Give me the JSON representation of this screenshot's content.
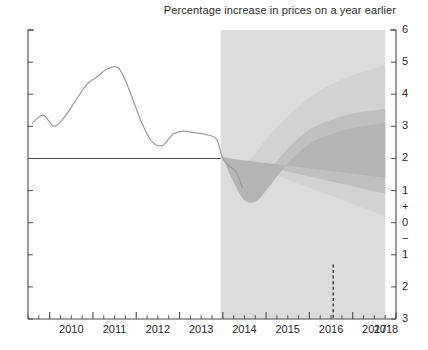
{
  "chart_data": {
    "type": "area",
    "title": "Percentage increase in prices on a year earlier",
    "subtitle": "",
    "xlabel": "",
    "ylabel": "",
    "grid": false,
    "legend_position": "none",
    "xlim": [
      2009.5,
      2018.0
    ],
    "ylim": [
      -3,
      6
    ],
    "y_ticks": [
      {
        "value": 6,
        "label": "6"
      },
      {
        "value": 5,
        "label": "5"
      },
      {
        "value": 4,
        "label": "4"
      },
      {
        "value": 3,
        "label": "3"
      },
      {
        "value": 2,
        "label": "2"
      },
      {
        "value": 1,
        "label": "1"
      },
      {
        "value": 0.5,
        "label": "+"
      },
      {
        "value": 0,
        "label": "0"
      },
      {
        "value": -0.5,
        "label": "−"
      },
      {
        "value": -1,
        "label": "1"
      },
      {
        "value": -2,
        "label": "2"
      },
      {
        "value": -3,
        "label": "3"
      }
    ],
    "x_ticks": [
      {
        "value": 2010,
        "label": "2010"
      },
      {
        "value": 2011,
        "label": "2011"
      },
      {
        "value": 2012,
        "label": "2012"
      },
      {
        "value": 2013,
        "label": "2013"
      },
      {
        "value": 2014,
        "label": "2014"
      },
      {
        "value": 2015,
        "label": "2015"
      },
      {
        "value": 2016,
        "label": "2016"
      },
      {
        "value": 2017,
        "label": "2017"
      },
      {
        "value": 2018,
        "label": "2018"
      }
    ],
    "x_minor_tick_step": 0.25,
    "annotations": [
      {
        "name": "inflation-target-line",
        "type": "hline",
        "y": 2.0,
        "x_start": 2009.5,
        "x_end": 2013.95,
        "style": "solid",
        "color": "#4a4a4a"
      },
      {
        "name": "forecast-shading",
        "type": "vspan",
        "x_start": 2013.95,
        "x_end": 2017.75,
        "color": "#dcdcdc"
      },
      {
        "name": "projection-marker-line",
        "type": "vline",
        "x": 2016.55,
        "y_start": -1.3,
        "y_end": -3.0,
        "style": "dashed",
        "color": "#333333"
      }
    ],
    "series": [
      {
        "name": "CPI inflation (history)",
        "type": "line",
        "color": "#9a9a9a",
        "x": [
          2009.6,
          2009.85,
          2010.1,
          2010.35,
          2010.6,
          2010.85,
          2011.1,
          2011.35,
          2011.6,
          2011.85,
          2012.1,
          2012.35,
          2012.6,
          2012.85,
          2013.1,
          2013.35,
          2013.6,
          2013.85,
          2014.0,
          2014.15,
          2014.3,
          2014.45
        ],
        "values": [
          3.1,
          3.35,
          3.0,
          3.3,
          3.8,
          4.3,
          4.55,
          4.8,
          4.8,
          4.1,
          3.2,
          2.55,
          2.4,
          2.75,
          2.85,
          2.8,
          2.75,
          2.6,
          2.0,
          1.75,
          1.6,
          1.1
        ]
      },
      {
        "name": "Fan band 90% (outer)",
        "type": "band",
        "color": "#d2d2d2",
        "x": [
          2014.0,
          2014.25,
          2014.5,
          2014.75,
          2015.0,
          2015.5,
          2016.0,
          2016.5,
          2017.0,
          2017.5,
          2017.75
        ],
        "upper": [
          2.1,
          1.9,
          1.85,
          2.15,
          2.6,
          3.3,
          3.9,
          4.3,
          4.6,
          4.8,
          4.9
        ],
        "lower": [
          1.9,
          0.3,
          -0.65,
          -1.3,
          -1.45,
          -1.0,
          -0.35,
          0.0,
          0.15,
          0.2,
          0.2
        ]
      },
      {
        "name": "Fan band 60% (middle)",
        "type": "band",
        "color": "#c0c0c0",
        "x": [
          2014.0,
          2014.25,
          2014.5,
          2014.75,
          2015.0,
          2015.5,
          2016.0,
          2016.5,
          2017.0,
          2017.5,
          2017.75
        ],
        "upper": [
          2.05,
          1.5,
          1.1,
          1.15,
          1.5,
          2.3,
          2.9,
          3.2,
          3.4,
          3.5,
          3.55
        ],
        "lower": [
          1.95,
          0.7,
          -0.2,
          -0.85,
          -1.0,
          -0.45,
          0.2,
          0.55,
          0.75,
          0.85,
          0.9
        ]
      },
      {
        "name": "Fan band 30% (central)",
        "type": "band",
        "color": "#b4b4b4",
        "x": [
          2014.0,
          2014.25,
          2014.5,
          2014.75,
          2015.0,
          2015.5,
          2016.0,
          2016.5,
          2017.0,
          2017.5,
          2017.75
        ],
        "upper": [
          2.02,
          1.25,
          0.7,
          0.65,
          1.0,
          1.85,
          2.45,
          2.75,
          2.95,
          3.05,
          3.1
        ],
        "lower": [
          1.98,
          0.95,
          0.25,
          -0.35,
          -0.5,
          0.1,
          0.75,
          1.05,
          1.25,
          1.35,
          1.4
        ]
      }
    ]
  },
  "axes": {
    "plot_left_px": 28,
    "plot_right_px": 396,
    "plot_top_px": 30,
    "plot_bottom_px": 319
  }
}
